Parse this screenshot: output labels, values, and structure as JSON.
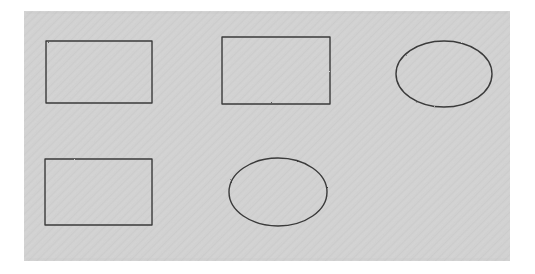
{
  "figure": {
    "title": "Scanned geometric shapes figure",
    "canvas": {
      "width": 535,
      "height": 274,
      "outer_background_color": "#ffffff"
    },
    "panel": {
      "label": "scanned-gray-panel",
      "x": 24,
      "y": 11,
      "width": 486,
      "height": 250,
      "fill_color": "#d2d2d2",
      "texture": "diagonal-scan-hatch",
      "texture_color": "#c8c8c8"
    },
    "stroke": {
      "color": "#3a3a3a",
      "width": 1.4,
      "style": "hand-drawn-outline"
    },
    "shape_count": 5,
    "shapes": [
      {
        "name": "rectangle-top-left",
        "type": "rectangle",
        "x": 46,
        "y": 41,
        "width": 106,
        "height": 62,
        "fill": "none"
      },
      {
        "name": "rectangle-top-middle",
        "type": "rectangle",
        "x": 222,
        "y": 37,
        "width": 108,
        "height": 67,
        "fill": "none"
      },
      {
        "name": "ellipse-top-right",
        "type": "ellipse",
        "cx": 444,
        "cy": 74,
        "rx": 48,
        "ry": 33,
        "fill": "none"
      },
      {
        "name": "rectangle-bottom-left",
        "type": "rectangle",
        "x": 45,
        "y": 159,
        "width": 107,
        "height": 66,
        "fill": "none"
      },
      {
        "name": "ellipse-bottom-middle",
        "type": "ellipse",
        "cx": 278,
        "cy": 192,
        "rx": 49,
        "ry": 34,
        "fill": "none"
      }
    ]
  }
}
